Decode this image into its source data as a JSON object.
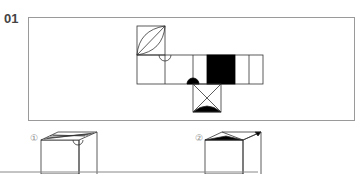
{
  "question": {
    "number": "01",
    "figure": "cube-net",
    "net_faces": [
      {
        "id": "top-square",
        "pattern": "diagonal-with-leaf"
      },
      {
        "id": "row-1",
        "pattern": "half-circle-top"
      },
      {
        "id": "row-2",
        "pattern": "blank"
      },
      {
        "id": "row-3",
        "pattern": "half-disc-bottom"
      },
      {
        "id": "row-4",
        "pattern": "black-fill"
      },
      {
        "id": "row-5",
        "pattern": "blank"
      },
      {
        "id": "bottom-square",
        "pattern": "x-with-black-half-disc"
      }
    ],
    "options": [
      {
        "label": "①",
        "figure": "cube-striped-top"
      },
      {
        "label": "②",
        "figure": "cube-triangle-top"
      }
    ]
  }
}
